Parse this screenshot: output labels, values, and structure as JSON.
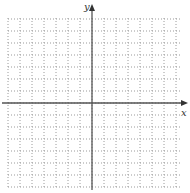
{
  "diagram": {
    "type": "coordinate-grid",
    "axes": {
      "x_label": "x",
      "y_label": "y",
      "origin_px": [
        92,
        103
      ]
    },
    "grid": {
      "left": 8,
      "right": 182,
      "top": 18,
      "bottom": 188,
      "cell": 12,
      "style": "dotted",
      "color": "#9a9a9a"
    },
    "axis_color": "#555555"
  }
}
